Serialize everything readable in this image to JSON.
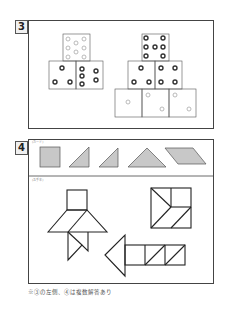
{
  "problems": [
    {
      "number": "3",
      "pyramids": [
        {
          "name": "left-pyramid",
          "rows": [
            [
              {
                "pips": 8,
                "style": "light"
              }
            ],
            [
              {
                "pips": 3,
                "style": "dark"
              },
              {
                "pips": 5,
                "style": "dark"
              }
            ]
          ]
        },
        {
          "name": "right-pyramid",
          "rows": [
            [
              {
                "pips": 8,
                "style": "dark"
              }
            ],
            [
              {
                "pips": 3,
                "style": "dark"
              },
              {
                "pips": 4,
                "style": "dark"
              }
            ],
            [
              {
                "pips": 1,
                "style": "light"
              },
              {
                "pips": 2,
                "style": "light"
              },
              {
                "pips": 2,
                "style": "light"
              }
            ]
          ]
        }
      ]
    },
    {
      "number": "4",
      "cards_label": "(カード)",
      "models_label": "(お手本)",
      "cards": [
        "square",
        "right-triangle-small",
        "right-triangle-small",
        "isosceles-triangle-large",
        "parallelogram"
      ],
      "models": [
        "rocket-figure",
        "square-figure",
        "arrow-figure"
      ]
    }
  ],
  "caption": "※③の左側、④は複数解答あり",
  "colors": {
    "line": "#333333",
    "card_fill": "#c8c8c8",
    "pip_dark": "#333333",
    "pip_light": "#aaaaaa"
  }
}
